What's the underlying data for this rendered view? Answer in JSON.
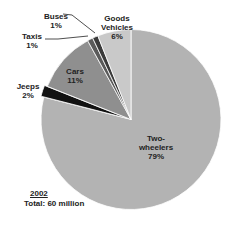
{
  "chart_data": {
    "type": "pie",
    "title": "",
    "subtitle": "2002",
    "annotation": "Total: 60 million",
    "start_angle": "12 o'clock, clockwise",
    "categories": [
      "Two-wheelers",
      "Jeeps",
      "Cars",
      "Taxis",
      "Buses",
      "Goods Vehicles"
    ],
    "values": [
      79,
      2,
      11,
      1,
      1,
      6
    ],
    "unit": "%",
    "colors": [
      "#b3b3b3",
      "#121212",
      "#8f8f8f",
      "#5a5a5a",
      "#3b3b3b",
      "#c9c9c9"
    ],
    "legend": "none (data labels on/near slices)"
  },
  "labels": [
    {
      "name": "Two-",
      "name2": "wheelers",
      "pct": "79%"
    },
    {
      "name": "Jeeps",
      "pct": "2%"
    },
    {
      "name": "Cars",
      "pct": "11%"
    },
    {
      "name": "Taxis",
      "pct": "1%"
    },
    {
      "name": "Buses",
      "pct": "1%"
    },
    {
      "name": "Goods",
      "name2": "Vehicles",
      "pct": "6%"
    }
  ],
  "caption": {
    "year": "2002",
    "total": "Total: 60 million"
  }
}
